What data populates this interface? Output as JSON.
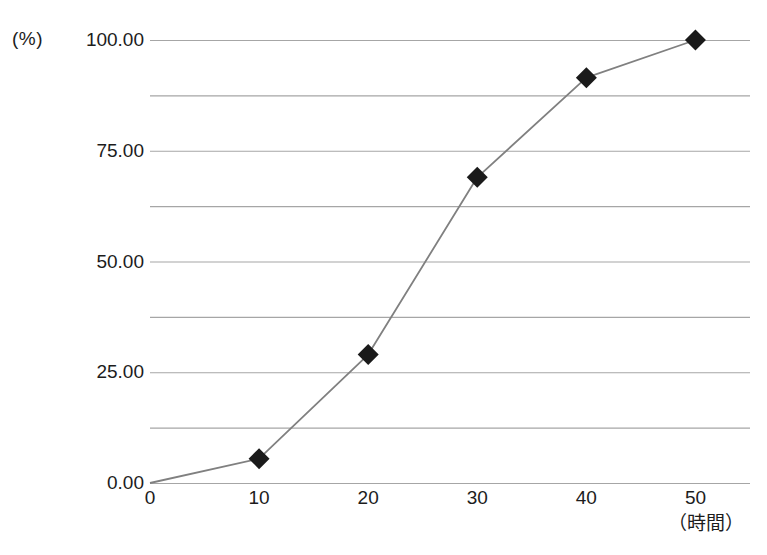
{
  "chart_data": {
    "type": "line",
    "title": "",
    "subtitle": "",
    "xlabel": "（時間）",
    "ylabel": "(%)",
    "x": [
      0,
      10,
      20,
      30,
      40,
      50
    ],
    "series": [
      {
        "name": "",
        "values": [
          0.0,
          5.5,
          29.0,
          69.0,
          91.5,
          100.0
        ]
      }
    ],
    "xlim": [
      0,
      55
    ],
    "ylim": [
      0,
      100
    ],
    "xticks": [
      0,
      10,
      20,
      30,
      40,
      50
    ],
    "xtick_labels": [
      "0",
      "10",
      "20",
      "30",
      "40",
      "50"
    ],
    "yticks": [
      0,
      25,
      50,
      75,
      100
    ],
    "ytick_labels": [
      "0.00",
      "25.00",
      "50.00",
      "75.00",
      "100.00"
    ],
    "minor_yticks": [
      12.5,
      37.5,
      62.5,
      87.5
    ],
    "grid": "horizontal",
    "legend": "none",
    "marker": "diamond",
    "marker_color": "#1a1a1a",
    "line_color": "#808080",
    "gridline_color": "#a6a6a6",
    "annotations": []
  },
  "axis": {
    "y_unit": "(%)",
    "x_unit": "（時間）"
  }
}
